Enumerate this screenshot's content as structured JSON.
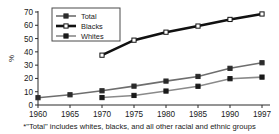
{
  "chart_data": {
    "type": "line",
    "title": "",
    "subtitle": "",
    "xlabel": "",
    "ylabel": "%",
    "ylim": [
      0,
      70
    ],
    "ytick_values": [
      0,
      10,
      20,
      30,
      40,
      50,
      60,
      70
    ],
    "ytick_labels": [
      "0",
      "10",
      "20",
      "30",
      "40",
      "50",
      "60",
      "70"
    ],
    "categories": [
      "1960",
      "1965",
      "1970",
      "1975",
      "1980",
      "1985",
      "1990",
      "1997"
    ],
    "x": [
      1960,
      1965,
      1970,
      1975,
      1980,
      1985,
      1990,
      1997
    ],
    "grid": false,
    "legend_position": "upper-left",
    "series": [
      {
        "name": "Total",
        "marker": "filled-square",
        "color": "#6e6e6e",
        "marker_color": "#2b2b2b",
        "line_width": 1.6,
        "values": [
          5.5,
          7.7,
          10.7,
          14.2,
          18.0,
          21.5,
          27.6,
          31.8
        ]
      },
      {
        "name": "Blacks",
        "marker": "open-square",
        "color": "#111111",
        "marker_color": "#111111",
        "line_width": 2.6,
        "values": [
          null,
          null,
          37.5,
          48.8,
          54.8,
          59.4,
          64.4,
          68.5
        ]
      },
      {
        "name": "Whites",
        "marker": "filled-square",
        "color": "#8a8a8a",
        "marker_color": "#1a1a1a",
        "line_width": 1.6,
        "values": [
          null,
          null,
          5.6,
          7.2,
          10.5,
          14.1,
          19.8,
          21.0
        ]
      }
    ],
    "annotations": [
      "*\"Total\" includes whites, blacks, and all other racial and ethnic groups"
    ]
  },
  "legend": {
    "entries": [
      {
        "label": "Total"
      },
      {
        "label": "Blacks"
      },
      {
        "label": "Whites"
      }
    ]
  },
  "footnote": {
    "text": "*\"Total\" includes whites, blacks, and all other racial and ethnic groups"
  },
  "axes": {
    "y_title": "%"
  },
  "colors": {
    "background": "#ffffff",
    "axis": "#2b2b2b",
    "total": "#6e6e6e",
    "blacks": "#111111",
    "whites": "#8a8a8a",
    "text": "#1a1a1a"
  }
}
